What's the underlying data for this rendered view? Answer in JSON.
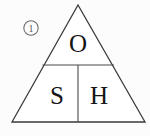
{
  "figure": {
    "type": "formula-triangle",
    "background_color": "#fcfcfc",
    "line_color": "#3a3a3a",
    "text_color": "#151515",
    "marker": {
      "label": "1",
      "shape": "circle",
      "border_color": "#6a6a6a"
    },
    "triangle": {
      "apex": {
        "x": 78,
        "y": 5
      },
      "base_left": {
        "x": 12,
        "y": 122
      },
      "base_right": {
        "x": 145,
        "y": 122
      },
      "horizontal_divider_y": 65,
      "vertical_divider_x": 78
    },
    "cells": [
      {
        "id": "top",
        "letter": "O",
        "position": {
          "x": 78,
          "y": 43
        }
      },
      {
        "id": "bottom-left",
        "letter": "S",
        "position": {
          "x": 57,
          "y": 95
        }
      },
      {
        "id": "bottom-right",
        "letter": "H",
        "position": {
          "x": 99,
          "y": 95
        }
      }
    ]
  }
}
